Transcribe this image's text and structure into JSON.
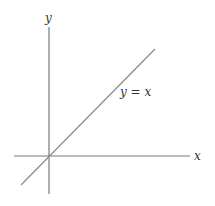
{
  "diagram": {
    "axes": {
      "x_label": "x",
      "y_label": "y",
      "color": "#7a7a7a"
    },
    "line": {
      "label": "y = x",
      "equation": "y = x",
      "color": "#8a8a8a"
    }
  }
}
